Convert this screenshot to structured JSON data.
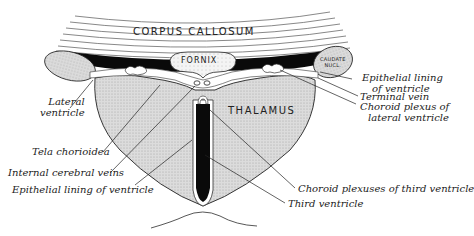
{
  "diagram": {
    "structures": {
      "corpus_callosum": "CORPUS   CALLOSUM",
      "fornix": "FORNIX",
      "thalamus": "THALAMUS",
      "caudate_line1": "CAUDATE",
      "caudate_line2": "NUCL."
    },
    "labels_left": {
      "lateral_ventricle_1": "Lateral",
      "lateral_ventricle_2": "ventricle",
      "tela_chorioidea": "Tela chorioidea",
      "internal_cerebral_veins": "Internal cerebral veins",
      "epithelial_lining": "Epithelial lining of ventricle"
    },
    "labels_right": {
      "epithelial_lining_1": "Epithelial lining",
      "epithelial_lining_2": "of ventricle",
      "terminal_vein": "Terminal vein",
      "choroid_plexus_lateral_1": "Choroid plexus of",
      "choroid_plexus_lateral_2": "lateral ventricle",
      "choroid_plexuses_third": "Choroid plexuses of third ventricle",
      "third_ventricle": "Third ventricle"
    },
    "colors": {
      "ink": "#222222",
      "tissue_fill": "#d6d6d6",
      "ventricle_fill": "#0a0a0a",
      "background": "#ffffff"
    }
  }
}
